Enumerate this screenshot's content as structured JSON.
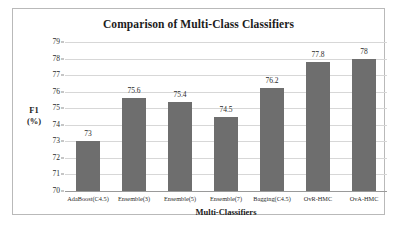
{
  "figure": {
    "background_color": "#ffffff",
    "border_color": "#b9b9b9",
    "bar_color": "#6e6e6e",
    "grid_color": "#d7d7d7"
  },
  "chart_data": {
    "type": "bar",
    "title": "Comparison of Multi-Class Classifiers",
    "xlabel": "Multi-Classifiers",
    "ylabel": "F1\n(%)",
    "ylabel_lines": [
      "F1",
      "(%)"
    ],
    "categories": [
      "AdaBoost(C4.5)",
      "Ensemble(3)",
      "Ensemble(5)",
      "Ensemble(7)",
      "Bagging(C4.5)",
      "OvR-HMC",
      "OvA-HMC"
    ],
    "values": [
      73,
      75.6,
      75.4,
      74.5,
      76.2,
      77.8,
      78
    ],
    "value_labels": [
      "73",
      "75.6",
      "75.4",
      "74.5",
      "76.2",
      "77.8",
      "78"
    ],
    "ylim": [
      70,
      79
    ],
    "ytick_step": 1,
    "ytick_labels": [
      "79",
      "78",
      "77",
      "76",
      "75",
      "74",
      "73",
      "72",
      "71",
      "70"
    ],
    "grid": "horizontal",
    "legend": "none",
    "series_name": "F1 (%)"
  }
}
